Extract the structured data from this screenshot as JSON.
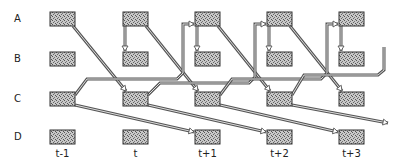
{
  "diagram": {
    "rows": [
      {
        "label": "A",
        "y": 12
      },
      {
        "label": "B",
        "y": 52
      },
      {
        "label": "C",
        "y": 92
      },
      {
        "label": "D",
        "y": 130
      }
    ],
    "columns": [
      {
        "label": "t-1",
        "x": 50
      },
      {
        "label": "t",
        "x": 123
      },
      {
        "label": "t+1",
        "x": 195
      },
      {
        "label": "t+2",
        "x": 267
      },
      {
        "label": "t+3",
        "x": 339
      }
    ],
    "box": {
      "width": 25,
      "height": 14,
      "fill": "#b5b5b5",
      "stroke": "#333333"
    },
    "arrow_color": "#555555",
    "connections": [
      {
        "from": "A,t-1",
        "to": "C,t",
        "type": "diagonal"
      },
      {
        "from": "A,t",
        "to": "C,t+1",
        "type": "diagonal"
      },
      {
        "from": "A,t+1",
        "to": "C,t+2",
        "type": "diagonal"
      },
      {
        "from": "A,t+2",
        "to": "C,t+3",
        "type": "diagonal"
      },
      {
        "from": "A,t",
        "to": "B,t",
        "type": "vertical"
      },
      {
        "from": "A,t+1",
        "to": "B,t+1",
        "type": "vertical"
      },
      {
        "from": "A,t+2",
        "to": "B,t+2",
        "type": "vertical"
      },
      {
        "from": "A,t+3",
        "to": "B,t+3",
        "type": "vertical"
      },
      {
        "from": "C,t-1",
        "to": "A,t+1",
        "type": "routed"
      },
      {
        "from": "C,t",
        "to": "A,t+2",
        "type": "routed"
      },
      {
        "from": "C,t+1",
        "to": "A,t+3",
        "type": "routed"
      },
      {
        "from": "C,t+2",
        "to": "beyond",
        "type": "routed"
      },
      {
        "from": "C,t-1",
        "to": "D,t+1",
        "type": "diagonal"
      },
      {
        "from": "C,t",
        "to": "D,t+2",
        "type": "diagonal"
      },
      {
        "from": "C,t+1",
        "to": "D,t+3",
        "type": "diagonal"
      },
      {
        "from": "C,t+2",
        "to": "beyond",
        "type": "diagonal"
      }
    ]
  }
}
